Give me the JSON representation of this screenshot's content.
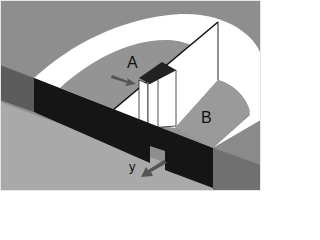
{
  "diagram": {
    "labels": {
      "a": "A",
      "b": "B",
      "y": "y"
    },
    "arrows": [
      {
        "name": "arrow-into-a",
        "direction": "right-down",
        "target": "A"
      },
      {
        "name": "arrow-y",
        "direction": "down-left",
        "target": "y"
      }
    ],
    "colors": {
      "background": "#8c8c8c",
      "floor_front": "#a9a9a9",
      "arc_white": "#ffffff",
      "inner_floor": "#959595",
      "wall_front_black": "#151515",
      "wall_side_dark": "#5c5c5c",
      "box_top": "#222222",
      "arrow": "#555555",
      "border": "#e8e8e8"
    }
  }
}
